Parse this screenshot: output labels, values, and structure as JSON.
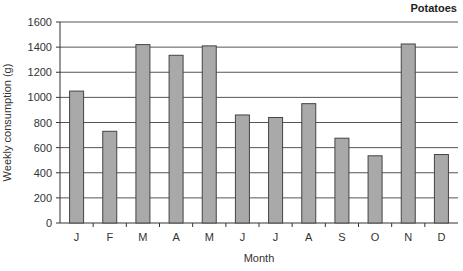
{
  "chart_data": {
    "type": "bar",
    "title": "Potatoes",
    "xlabel": "Month",
    "ylabel": "Weekly consumption (g)",
    "categories": [
      "J",
      "F",
      "M",
      "A",
      "M",
      "J",
      "J",
      "A",
      "S",
      "O",
      "N",
      "D"
    ],
    "values": [
      1050,
      730,
      1420,
      1335,
      1410,
      860,
      840,
      950,
      675,
      535,
      1425,
      545
    ],
    "ylim": [
      0,
      1600
    ],
    "yticks": [
      0,
      200,
      400,
      600,
      800,
      1000,
      1200,
      1400,
      1600
    ],
    "grid": true,
    "legend": "none",
    "colors": {
      "bar": "#a9a9a9",
      "bar_edge": "#444444",
      "grid": "#555555"
    }
  }
}
